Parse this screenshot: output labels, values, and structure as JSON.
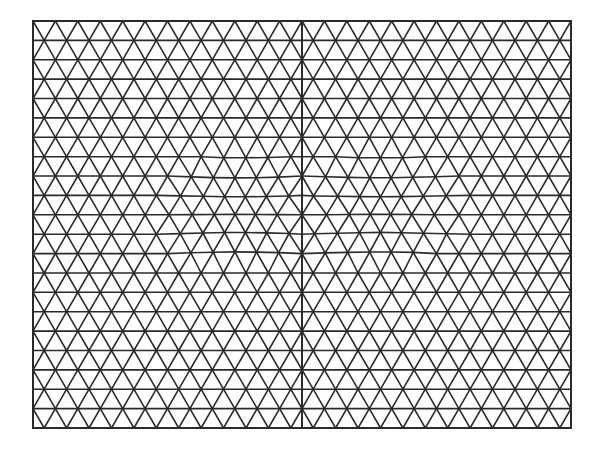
{
  "diagram": {
    "type": "triangular-mesh",
    "bounds": {
      "x0": 33,
      "y0": 21,
      "x1": 571,
      "y1": 428
    },
    "center_line_x": 302,
    "rows": 21,
    "cols_per_half": 12,
    "stroke_color": "#2a2a2a",
    "background": "#ffffff",
    "stroke_width": 1.6,
    "refined_regions": [
      {
        "cx": 238,
        "cy": 211,
        "rx": 62,
        "ry": 48
      },
      {
        "cx": 380,
        "cy": 211,
        "rx": 62,
        "ry": 48
      }
    ]
  }
}
